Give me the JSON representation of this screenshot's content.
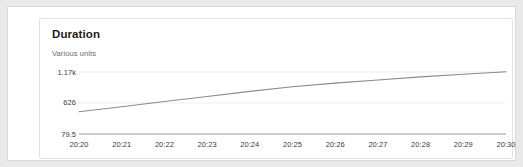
{
  "card": {
    "title": "Duration",
    "subtitle": "Various units"
  },
  "colors": {
    "page_background": "#e9e9e9",
    "card_background": "#ffffff",
    "card_border": "#e2e2e2",
    "title_text": "#1c1c1c",
    "subtitle_text": "#6c6c6c",
    "tick_text": "#3c3c3c",
    "gridline": "#ededed",
    "axis_line": "#9a9a9a",
    "series_line": "#8a8a8a"
  },
  "chart_data": {
    "type": "line",
    "title": "Duration",
    "subtitle": "Various units",
    "xlabel": "",
    "ylabel": "Various units",
    "grid": true,
    "legend": "none",
    "x": [
      "20:20",
      "20:21",
      "20:22",
      "20:23",
      "20:24",
      "20:25",
      "20:26",
      "20:27",
      "20:28",
      "20:29",
      "20:30"
    ],
    "ytick_labels": [
      "79.5",
      "626",
      "1.17k"
    ],
    "ytick_values": [
      79.5,
      626,
      1170
    ],
    "ylim": [
      79.5,
      1170
    ],
    "series": [
      {
        "name": "Duration",
        "values": [
          470,
          560,
          650,
          740,
          830,
          910,
          975,
          1030,
          1085,
          1130,
          1175
        ]
      }
    ]
  }
}
